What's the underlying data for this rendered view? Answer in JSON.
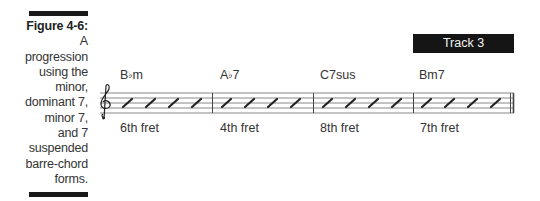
{
  "figure": {
    "label": "Figure 4-6:",
    "caption_lines": [
      "A",
      "progression",
      "using the",
      "minor,",
      "dominant 7,",
      "minor 7,",
      "and 7",
      "suspended",
      "barre-chord",
      "forms."
    ]
  },
  "track": {
    "label": "Track 3"
  },
  "notation": {
    "clef": "treble-clef",
    "slashes_per_measure": 4,
    "measures": [
      {
        "chord_root": "B",
        "chord_flat": "♭",
        "chord_suffix": "m",
        "fret": "6th fret"
      },
      {
        "chord_root": "A",
        "chord_flat": "♭",
        "chord_suffix": "7",
        "fret": "4th fret"
      },
      {
        "chord_root": "C7sus",
        "chord_flat": "",
        "chord_suffix": "",
        "fret": "8th fret"
      },
      {
        "chord_root": "Bm7",
        "chord_flat": "",
        "chord_suffix": "",
        "fret": "7th fret"
      }
    ]
  },
  "colors": {
    "ink": "#2b2b2b",
    "bar": "#1a1a1a",
    "staff": "#555555",
    "track_bg": "#151515",
    "track_text": "#f2f2f2"
  }
}
